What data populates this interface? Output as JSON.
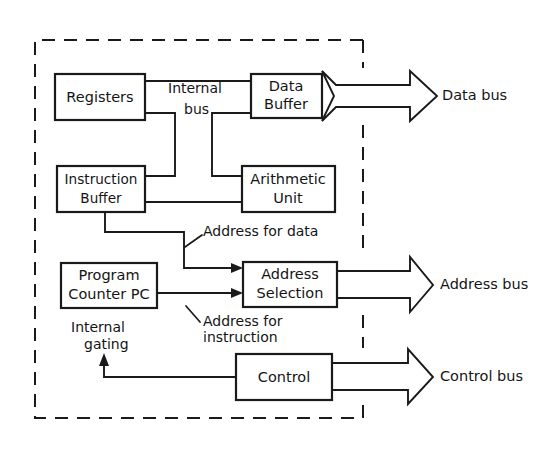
{
  "diagram": {
    "boundary": {
      "name": "cpu-chip-boundary",
      "style": "dashed"
    },
    "colors": {
      "background": "#ffffff",
      "ink": "#1a1a1a",
      "text": "#151515"
    },
    "blocks": [
      {
        "id": "registers",
        "label_lines": [
          "Registers"
        ]
      },
      {
        "id": "data-buffer",
        "label_lines": [
          "Data",
          "Buffer"
        ]
      },
      {
        "id": "instruction-buffer",
        "label_lines": [
          "Instruction",
          "Buffer"
        ]
      },
      {
        "id": "arithmetic-unit",
        "label_lines": [
          "Arithmetic",
          "Unit"
        ]
      },
      {
        "id": "program-counter",
        "label_lines": [
          "Program",
          "Counter PC"
        ]
      },
      {
        "id": "address-selection",
        "label_lines": [
          "Address",
          "Selection"
        ]
      },
      {
        "id": "control",
        "label_lines": [
          "Control"
        ]
      }
    ],
    "annotations": [
      {
        "id": "internal-bus",
        "label_lines": [
          "Internal",
          "bus"
        ]
      },
      {
        "id": "address-for-data",
        "label_lines": [
          "Address for data"
        ]
      },
      {
        "id": "address-for-instruction",
        "label_lines": [
          "Address for",
          "instruction"
        ]
      },
      {
        "id": "internal-gating",
        "label_lines": [
          "Internal",
          "gating"
        ]
      }
    ],
    "buses": [
      {
        "id": "data-bus",
        "label": "Data bus",
        "direction": "bidirectional"
      },
      {
        "id": "address-bus",
        "label": "Address bus",
        "direction": "outgoing"
      },
      {
        "id": "control-bus",
        "label": "Control bus",
        "direction": "outgoing"
      }
    ]
  }
}
